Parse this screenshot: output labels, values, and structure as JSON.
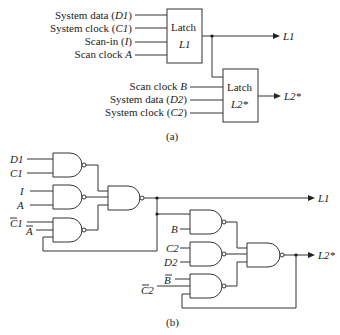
{
  "part_a": {
    "latch1": {
      "title": "Latch",
      "name": "L1",
      "inputs": [
        {
          "label": "System data (",
          "sym": "D1",
          "close": ")"
        },
        {
          "label": "System clock (",
          "sym": "C1",
          "close": ")"
        },
        {
          "label": "Scan-in (",
          "sym": "I",
          "close": ")"
        },
        {
          "label": "Scan clock ",
          "sym": "A",
          "close": ""
        }
      ],
      "output": "L1"
    },
    "latch2": {
      "title": "Latch",
      "name": "L2*",
      "inputs": [
        {
          "label": "Scan clock ",
          "sym": "B",
          "close": ""
        },
        {
          "label": "System data (",
          "sym": "D2",
          "close": ")"
        },
        {
          "label": "System clock (",
          "sym": "C2",
          "close": ")"
        }
      ],
      "output": "L2*"
    },
    "caption": "(a)"
  },
  "part_b": {
    "inputs_l1": [
      "D1",
      "C1",
      "I",
      "A",
      "C1",
      "A"
    ],
    "inputs_l2": [
      "B",
      "C2",
      "D2",
      "B",
      "C2"
    ],
    "output_l1": "L1",
    "output_l2": "L2*",
    "caption": "(b)"
  }
}
